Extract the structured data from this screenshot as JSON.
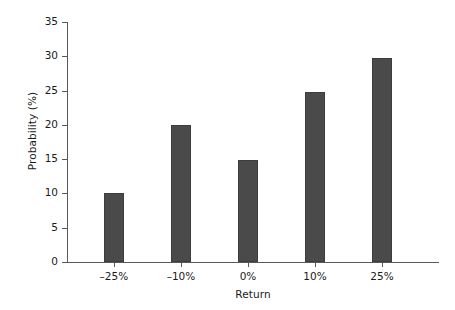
{
  "chart_data": {
    "type": "bar",
    "title": "",
    "xlabel": "Return",
    "ylabel": "Probability (%)",
    "categories": [
      "–25%",
      "–10%",
      "0%",
      "10%",
      "25%"
    ],
    "values": [
      10.0,
      20.0,
      14.9,
      24.8,
      29.7
    ],
    "ylim": [
      0,
      35
    ],
    "yticks": [
      0,
      5,
      10,
      15,
      20,
      25,
      30,
      35
    ],
    "ytick_labels": [
      "0",
      "5",
      "10",
      "15",
      "20",
      "25",
      "30",
      "35"
    ],
    "grid": false,
    "legend": null,
    "bar_color": "#4a4a4a",
    "axis_color": "#595959",
    "background_color": "#ffffff"
  }
}
